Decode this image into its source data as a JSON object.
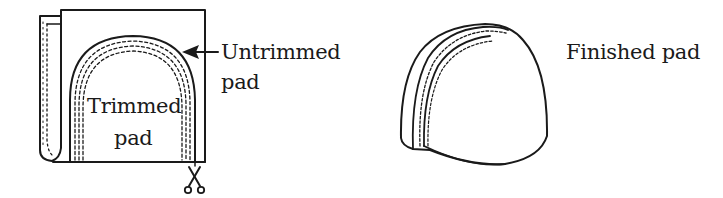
{
  "figure": {
    "left_panel": {
      "title": "Pad trimming",
      "labels": {
        "untrimmed_line1": "Untrimmed",
        "untrimmed_line2": "pad",
        "trimmed_line1": "Trimmed",
        "trimmed_line2": "pad"
      },
      "icons": [
        "arrow-left-icon",
        "scissors-icon"
      ]
    },
    "right_panel": {
      "labels": {
        "finished": "Finished pad"
      }
    },
    "colors": {
      "ink": "#1a1a1a",
      "background": "#ffffff"
    }
  }
}
